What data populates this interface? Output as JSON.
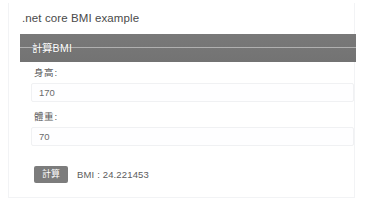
{
  "app": {
    "title": ".net core BMI example"
  },
  "panel": {
    "header_title": "計算BMI",
    "fields": [
      {
        "label": "身高:",
        "value": "170",
        "placeholder": "身高"
      },
      {
        "label": "體重:",
        "value": "70",
        "placeholder": "體重"
      }
    ],
    "submit_label": "計算",
    "result_text": "BMI : 24.221453"
  },
  "colors": {
    "page_background": "#ffffff",
    "card_border": "#f2f3f5",
    "panel_header": "#757575",
    "button": "#7c7c7c",
    "title_text": "#4a4a4a",
    "label_text": "#5a5a5a",
    "input_text": "#6b6b6b",
    "header_text": "#ffffff"
  }
}
